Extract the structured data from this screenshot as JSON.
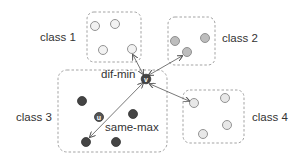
{
  "diagram": {
    "classes": [
      {
        "id": "class1",
        "label": "class 1"
      },
      {
        "id": "class2",
        "label": "class 2"
      },
      {
        "id": "class3",
        "label": "class 3"
      },
      {
        "id": "class4",
        "label": "class 4"
      }
    ],
    "annotations": {
      "dif_min": "dif-min",
      "same_max": "same-max"
    },
    "points": {
      "v": "v",
      "u": "u"
    },
    "colors": {
      "box_border": "#999999",
      "class1_fill": "#f2f2f2",
      "class2_fill": "#bdbdbd",
      "class3_fill": "#444444",
      "class4_fill": "#e8e8e8",
      "point_stroke": "#888888",
      "arrow": "#555555",
      "text": "#333333"
    }
  }
}
